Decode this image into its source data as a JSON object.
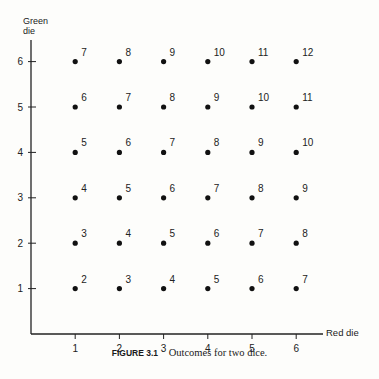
{
  "chart_data": {
    "type": "scatter",
    "title": "Outcomes for two dice.",
    "figure_label": "FIGURE 3.1",
    "xlabel": "Red die",
    "ylabel_line1": "Green",
    "ylabel_line2": "die",
    "x_ticks": [
      1,
      2,
      3,
      4,
      5,
      6
    ],
    "y_ticks": [
      1,
      2,
      3,
      4,
      5,
      6
    ],
    "xlim": [
      0,
      6.6
    ],
    "ylim": [
      0,
      6.5
    ],
    "grid": false,
    "points": [
      {
        "x": 1,
        "y": 1,
        "label": "2"
      },
      {
        "x": 2,
        "y": 1,
        "label": "3"
      },
      {
        "x": 3,
        "y": 1,
        "label": "4"
      },
      {
        "x": 4,
        "y": 1,
        "label": "5"
      },
      {
        "x": 5,
        "y": 1,
        "label": "6"
      },
      {
        "x": 6,
        "y": 1,
        "label": "7"
      },
      {
        "x": 1,
        "y": 2,
        "label": "3"
      },
      {
        "x": 2,
        "y": 2,
        "label": "4"
      },
      {
        "x": 3,
        "y": 2,
        "label": "5"
      },
      {
        "x": 4,
        "y": 2,
        "label": "6"
      },
      {
        "x": 5,
        "y": 2,
        "label": "7"
      },
      {
        "x": 6,
        "y": 2,
        "label": "8"
      },
      {
        "x": 1,
        "y": 3,
        "label": "4"
      },
      {
        "x": 2,
        "y": 3,
        "label": "5"
      },
      {
        "x": 3,
        "y": 3,
        "label": "6"
      },
      {
        "x": 4,
        "y": 3,
        "label": "7"
      },
      {
        "x": 5,
        "y": 3,
        "label": "8"
      },
      {
        "x": 6,
        "y": 3,
        "label": "9"
      },
      {
        "x": 1,
        "y": 4,
        "label": "5"
      },
      {
        "x": 2,
        "y": 4,
        "label": "6"
      },
      {
        "x": 3,
        "y": 4,
        "label": "7"
      },
      {
        "x": 4,
        "y": 4,
        "label": "8"
      },
      {
        "x": 5,
        "y": 4,
        "label": "9"
      },
      {
        "x": 6,
        "y": 4,
        "label": "10"
      },
      {
        "x": 1,
        "y": 5,
        "label": "6"
      },
      {
        "x": 2,
        "y": 5,
        "label": "7"
      },
      {
        "x": 3,
        "y": 5,
        "label": "8"
      },
      {
        "x": 4,
        "y": 5,
        "label": "9"
      },
      {
        "x": 5,
        "y": 5,
        "label": "10"
      },
      {
        "x": 6,
        "y": 5,
        "label": "11"
      },
      {
        "x": 1,
        "y": 6,
        "label": "7"
      },
      {
        "x": 2,
        "y": 6,
        "label": "8"
      },
      {
        "x": 3,
        "y": 6,
        "label": "9"
      },
      {
        "x": 4,
        "y": 6,
        "label": "10"
      },
      {
        "x": 5,
        "y": 6,
        "label": "11"
      },
      {
        "x": 6,
        "y": 6,
        "label": "12"
      }
    ]
  }
}
